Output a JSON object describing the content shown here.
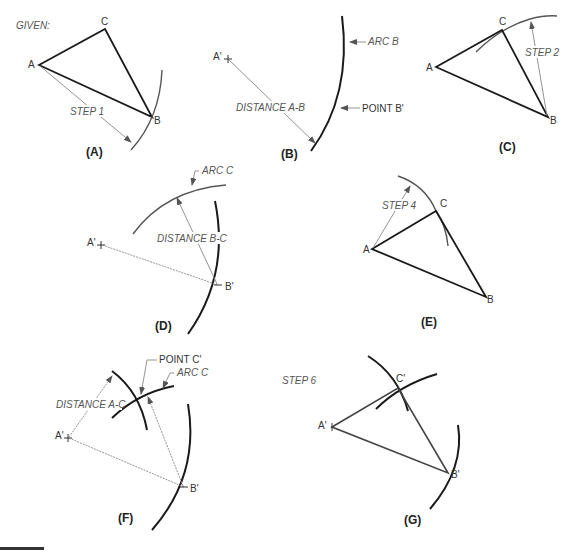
{
  "title": "GIVEN:",
  "panels": {
    "A": {
      "label": "(A)",
      "vertices": {
        "A": "A",
        "B": "B",
        "C": "C"
      },
      "step": "STEP 1"
    },
    "B": {
      "label": "(B)",
      "point": "A'",
      "dimension": "DISTANCE A-B",
      "arc_label": "ARC B",
      "point_label": "POINT B'"
    },
    "C": {
      "label": "(C)",
      "vertices": {
        "A": "A",
        "B": "B",
        "C": "C"
      },
      "step": "STEP 2"
    },
    "D": {
      "label": "(D)",
      "point_a": "A'",
      "point_b": "B'",
      "arc_label": "ARC C",
      "dimension": "DISTANCE B-C"
    },
    "E": {
      "label": "(E)",
      "vertices": {
        "A": "A",
        "B": "B",
        "C": "C"
      },
      "step": "STEP 4"
    },
    "F": {
      "label": "(F)",
      "point_a": "A'",
      "point_b": "B'",
      "point_c_label": "POINT C'",
      "arc_label": "ARC C",
      "dimension": "DISTANCE A-C"
    },
    "G": {
      "label": "(G)",
      "step": "STEP 6",
      "point_a": "A'",
      "point_b": "B'",
      "point_c": "C'"
    }
  },
  "colors": {
    "line": "#1a1a1a",
    "arc": "#555555",
    "dimension": "#888888",
    "background": "#ffffff"
  }
}
